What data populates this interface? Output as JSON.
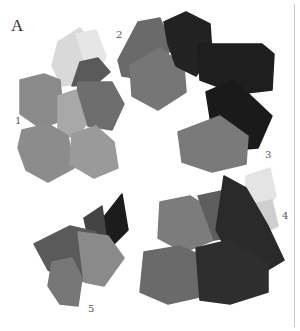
{
  "figure": {
    "panel_letter": "A",
    "background": "#ffffff",
    "rule_color": "#c8c8c8"
  },
  "groups": [
    {
      "label": "1",
      "label_pos": [
        15,
        116
      ],
      "swatches": [
        {
          "tone": "#d9d9d9",
          "points": "58,42 80,28 100,52 88,82 62,86 52,66"
        },
        {
          "tone": "#e6e6e6",
          "points": "76,34 96,30 106,56 96,80 84,60"
        },
        {
          "tone": "#8a8a8a",
          "points": "20,80 44,74 60,80 64,120 40,128 20,114"
        },
        {
          "tone": "#5a5a5a",
          "points": "80,62 98,58 110,72 96,84 72,86"
        },
        {
          "tone": "#6e6e6e",
          "points": "78,82 112,82 124,104 112,130 88,126 76,108"
        },
        {
          "tone": "#a8a8a8",
          "points": "58,96 76,90 86,124 76,140 58,130"
        },
        {
          "tone": "#8c8c8c",
          "points": "22,130 48,124 68,136 74,168 48,182 26,170 18,148"
        },
        {
          "tone": "#9a9a9a",
          "points": "72,134 96,126 114,142 118,168 94,178 70,164"
        }
      ]
    },
    {
      "label": "2",
      "label_pos": [
        116,
        30
      ],
      "swatches": [
        {
          "tone": "#6a6a6a",
          "points": "118,60 138,22 160,18 172,48 148,80 122,76"
        },
        {
          "tone": "#767676",
          "points": "130,66 160,48 184,66 186,92 158,110 132,96"
        },
        {
          "tone": "#222222",
          "points": "164,22 186,12 210,24 212,54 196,76 176,66 168,44"
        },
        {
          "tone": "#1e1e1e",
          "points": "198,44 262,44 274,54 272,90 238,94 200,80"
        }
      ]
    },
    {
      "label": "3",
      "label_pos": [
        265,
        150
      ],
      "swatches": [
        {
          "tone": "#1a1a1a",
          "points": "206,92 234,80 272,116 258,148 232,150 212,130"
        },
        {
          "tone": "#7a7a7a",
          "points": "178,132 220,116 248,136 246,164 212,172 182,162"
        }
      ]
    },
    {
      "label": "4",
      "label_pos": [
        282,
        211
      ],
      "swatches": [
        {
          "tone": "#e4e4e4",
          "points": "246,176 270,168 276,196 262,214 244,204"
        },
        {
          "tone": "#cfcfcf",
          "points": "254,204 272,200 278,226 266,232"
        },
        {
          "tone": "#7c7c7c",
          "points": "160,202 190,196 212,210 214,240 184,252 158,238"
        },
        {
          "tone": "#5e5e5e",
          "points": "198,196 226,190 244,206 242,236 214,240"
        },
        {
          "tone": "#2a2a2a",
          "points": "224,176 246,188 268,226 284,260 264,272 230,256 216,230"
        },
        {
          "tone": "#6a6a6a",
          "points": "144,252 180,246 202,256 204,296 168,304 140,292"
        },
        {
          "tone": "#2e2e2e",
          "points": "196,248 230,240 268,264 268,292 230,304 200,300"
        }
      ]
    },
    {
      "label": "5",
      "label_pos": [
        88,
        304
      ],
      "swatches": [
        {
          "tone": "#1c1c1c",
          "points": "100,222 122,194 128,230 112,246 98,238"
        },
        {
          "tone": "#444444",
          "points": "84,218 102,206 106,236 90,246"
        },
        {
          "tone": "#5a5a5a",
          "points": "34,244 70,226 96,232 100,272 72,286 48,270"
        },
        {
          "tone": "#8a8a8a",
          "points": "78,232 108,236 124,258 104,286 84,282"
        },
        {
          "tone": "#777777",
          "points": "52,262 72,258 82,278 78,306 60,304 48,286"
        }
      ]
    }
  ]
}
